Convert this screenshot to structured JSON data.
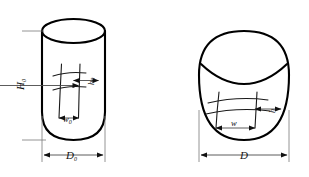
{
  "figure": {
    "background_color": "#ffffff",
    "line_color": "#000000",
    "figures": [
      {
        "id": "left",
        "shape_name": "cylinder-with-rounded-bottom",
        "labels": {
          "height": "H",
          "height_sub": "0",
          "diameter": "D",
          "diameter_sub": "0",
          "bulge_height": "h",
          "bulge_height_sub": "0",
          "bulge_width": "w",
          "bulge_width_sub": "0"
        }
      },
      {
        "id": "right",
        "shape_name": "barrel-spherical-billet",
        "labels": {
          "diameter": "D",
          "bulge_height": "h",
          "bulge_width": "w"
        }
      }
    ]
  }
}
